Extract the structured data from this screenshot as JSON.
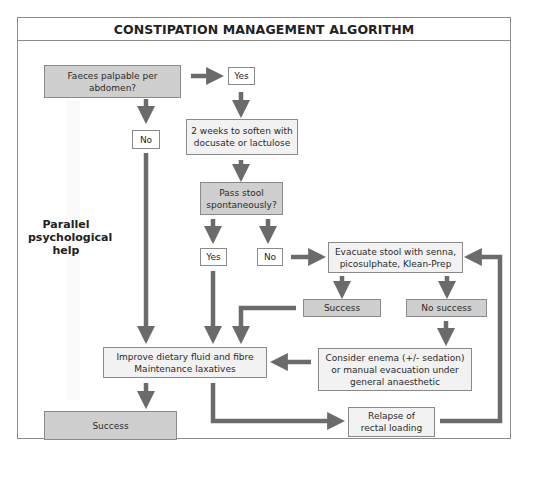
{
  "title": "CONSTIPATION MANAGEMENT ALGORITHM",
  "side_note": "Parallel\npsychological\nhelp",
  "nodes": {
    "faeces_palpable": "Faeces palpable per abdomen?",
    "yes_1": "Yes",
    "no_1": "No",
    "soften": "2 weeks to soften with\ndocusate or lactulose",
    "pass_stool": "Pass stool\nspontaneously?",
    "yes_2": "Yes",
    "no_2": "No",
    "evacuate": "Evacuate stool with senna,\npicosulphate, Klean-Prep",
    "success_evac": "Success",
    "no_success": "No success",
    "improve_diet": "Improve dietary fluid and fibre\nMaintenance laxatives",
    "consider_enema": "Consider enema (+/- sedation)\nor manual evacuation under\ngeneral anaesthetic",
    "success_final": "Success",
    "relapse": "Relapse of\nrectal loading"
  },
  "colors": {
    "decision_fill": "#cfcfcf",
    "action_fill": "#f2f2f2",
    "arrow": "#6b6b6b",
    "border": "#8a8a8a"
  }
}
